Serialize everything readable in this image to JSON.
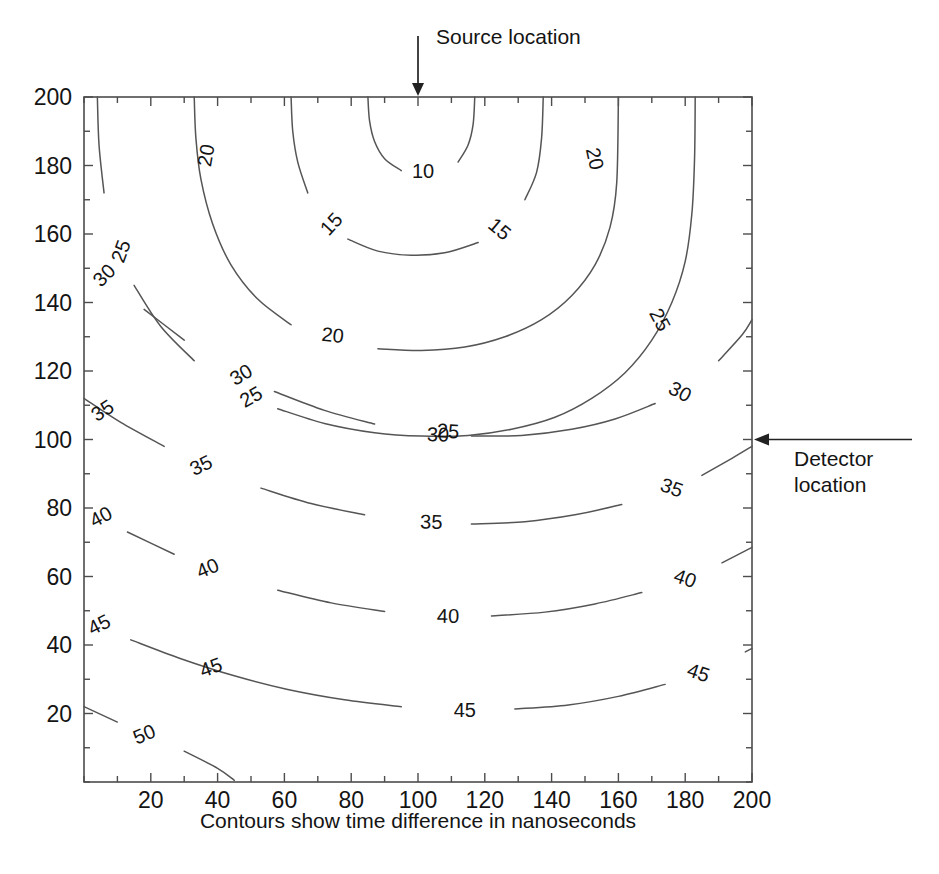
{
  "figure": {
    "kind": "contour-plot",
    "background_color": "#ffffff",
    "line_color": "#555555",
    "axis_color": "#4c4c4c",
    "text_color": "#141414"
  },
  "annotations": [
    {
      "id": "source",
      "label": "Source location",
      "target_x": 100,
      "target_y": 200,
      "direction": "down"
    },
    {
      "id": "detector",
      "label": "Detector\nlocation",
      "label_line1": "Detector",
      "label_line2": "location",
      "target_x": 200,
      "target_y": 100,
      "direction": "left"
    }
  ],
  "chart_data": {
    "type": "line",
    "subtype": "contour",
    "title": "",
    "xlabel": "Contours show time difference in nanoseconds",
    "ylabel": "",
    "xlim": [
      0,
      200
    ],
    "ylim": [
      0,
      200
    ],
    "grid": false,
    "legend": "none",
    "xticks": [
      20,
      40,
      60,
      80,
      100,
      120,
      140,
      160,
      180,
      200
    ],
    "yticks": [
      20,
      40,
      60,
      80,
      100,
      120,
      140,
      160,
      180,
      200
    ],
    "xtick_labels": [
      "20",
      "40",
      "60",
      "80",
      "100",
      "120",
      "140",
      "160",
      "180",
      "200"
    ],
    "ytick_labels": [
      "20",
      "40",
      "60",
      "80",
      "100",
      "120",
      "140",
      "160",
      "180",
      "200"
    ],
    "xtick_minor_step": 10,
    "ytick_minor_step": 10,
    "contour_levels": [
      10,
      15,
      20,
      25,
      30,
      35,
      40,
      45,
      50
    ],
    "contour_unit": "nanoseconds",
    "source_point": [
      100,
      200
    ],
    "detector_point": [
      200,
      100
    ],
    "contours": [
      {
        "level": 10,
        "points": [
          [
            85,
            200
          ],
          [
            85.5,
            193
          ],
          [
            87,
            187
          ],
          [
            90,
            182
          ],
          [
            95,
            178.5
          ],
          [
            101,
            177
          ],
          [
            107,
            178
          ],
          [
            112,
            181
          ],
          [
            115,
            186
          ],
          [
            116.5,
            192
          ],
          [
            117,
            200
          ]
        ],
        "labels": [
          {
            "text": "10",
            "x": 101.5,
            "y": 178.5,
            "rot": 0
          }
        ]
      },
      {
        "level": 15,
        "points": [
          [
            62,
            200
          ],
          [
            62.5,
            190
          ],
          [
            64,
            181
          ],
          [
            67,
            172
          ],
          [
            72,
            164
          ],
          [
            79,
            158.5
          ],
          [
            88,
            155
          ],
          [
            98,
            153.8
          ],
          [
            108,
            154.5
          ],
          [
            118,
            157.5
          ],
          [
            126,
            163
          ],
          [
            132,
            170
          ],
          [
            135.5,
            178
          ],
          [
            137,
            188
          ],
          [
            137.5,
            200
          ]
        ],
        "labels": [
          {
            "text": "15",
            "x": 74,
            "y": 163,
            "rot": -47
          },
          {
            "text": "15",
            "x": 124.5,
            "y": 161.5,
            "rot": 40
          }
        ]
      },
      {
        "level": 20,
        "points": [
          [
            33,
            200
          ],
          [
            33.5,
            188
          ],
          [
            35,
            176
          ],
          [
            38.5,
            163
          ],
          [
            44,
            151
          ],
          [
            52,
            141
          ],
          [
            62,
            133.5
          ],
          [
            74,
            129
          ],
          [
            88,
            126.5
          ],
          [
            101,
            126
          ],
          [
            114,
            127
          ],
          [
            126,
            130
          ],
          [
            137,
            135
          ],
          [
            146,
            142
          ],
          [
            153,
            151
          ],
          [
            157.5,
            162
          ],
          [
            159.5,
            175
          ],
          [
            160,
            200
          ]
        ],
        "labels": [
          {
            "text": "20",
            "x": 36.5,
            "y": 183,
            "rot": -80
          },
          {
            "text": "20",
            "x": 74.5,
            "y": 130.5,
            "rot": 6
          },
          {
            "text": "20",
            "x": 153,
            "y": 182,
            "rot": 78
          }
        ]
      },
      {
        "level": 25,
        "points": [
          [
            4,
            200
          ],
          [
            4.5,
            186
          ],
          [
            6,
            172
          ],
          [
            9.5,
            158
          ],
          [
            15,
            145
          ],
          [
            23,
            133
          ],
          [
            33,
            123
          ],
          [
            45,
            115
          ],
          [
            58,
            109
          ],
          [
            72,
            104.7
          ],
          [
            87,
            102
          ],
          [
            101,
            101
          ],
          [
            115,
            101.2
          ],
          [
            128,
            103
          ],
          [
            141,
            106.5
          ],
          [
            152,
            112
          ],
          [
            162,
            119.5
          ],
          [
            170,
            129
          ],
          [
            176,
            140
          ],
          [
            180,
            152
          ],
          [
            182,
            166
          ],
          [
            182.8,
            182
          ],
          [
            183,
            200
          ]
        ],
        "labels": [
          {
            "text": "25",
            "x": 11,
            "y": 155,
            "rot": -70
          },
          {
            "text": "25",
            "x": 50,
            "y": 112.5,
            "rot": -30
          },
          {
            "text": "25",
            "x": 109,
            "y": 102.5,
            "rot": 3
          },
          {
            "text": "25",
            "x": 172.5,
            "y": 135,
            "rot": 62
          }
        ]
      },
      {
        "level": 30,
        "points": [
          [
            0,
            156
          ],
          [
            8,
            147
          ],
          [
            18,
            138
          ],
          [
            30,
            129
          ],
          [
            43,
            121
          ],
          [
            57,
            114
          ],
          [
            72,
            108.5
          ],
          [
            87,
            104.5
          ],
          [
            101,
            102
          ],
          [
            116,
            101
          ],
          [
            131,
            101.2
          ],
          [
            146,
            103
          ],
          [
            159,
            106
          ],
          [
            171,
            110.5
          ],
          [
            181,
            116
          ],
          [
            190,
            123
          ],
          [
            197,
            130.5
          ],
          [
            200,
            135
          ]
        ],
        "labels": [
          {
            "text": "30",
            "x": 6,
            "y": 148,
            "rot": -45
          },
          {
            "text": "30",
            "x": 47,
            "y": 119,
            "rot": -31
          },
          {
            "text": "30",
            "x": 106,
            "y": 101.5,
            "rot": 2
          },
          {
            "text": "30",
            "x": 178.5,
            "y": 114,
            "rot": 28
          }
        ]
      },
      {
        "level": 35,
        "points": [
          [
            0,
            112
          ],
          [
            11,
            105
          ],
          [
            24,
            98
          ],
          [
            38,
            91.5
          ],
          [
            53,
            85.8
          ],
          [
            68,
            81.3
          ],
          [
            84,
            78
          ],
          [
            100,
            76
          ],
          [
            116,
            75.3
          ],
          [
            132,
            76
          ],
          [
            147,
            78
          ],
          [
            161,
            81
          ],
          [
            174,
            85
          ],
          [
            185,
            89.5
          ],
          [
            194,
            94.5
          ],
          [
            200,
            98
          ]
        ],
        "labels": [
          {
            "text": "35",
            "x": 5.5,
            "y": 108.5,
            "rot": -33
          },
          {
            "text": "35",
            "x": 35,
            "y": 92.5,
            "rot": -26
          },
          {
            "text": "35",
            "x": 104,
            "y": 76,
            "rot": 1
          },
          {
            "text": "35",
            "x": 176,
            "y": 86,
            "rot": 20
          }
        ]
      },
      {
        "level": 40,
        "points": [
          [
            0,
            80
          ],
          [
            13,
            73
          ],
          [
            27,
            66.5
          ],
          [
            42,
            60.8
          ],
          [
            58,
            56
          ],
          [
            74,
            52.3
          ],
          [
            90,
            49.8
          ],
          [
            106,
            48.5
          ],
          [
            122,
            48.5
          ],
          [
            138,
            49.6
          ],
          [
            153,
            52
          ],
          [
            167,
            55.3
          ],
          [
            180,
            59.5
          ],
          [
            191,
            64
          ],
          [
            200,
            68.5
          ]
        ],
        "labels": [
          {
            "text": "40",
            "x": 5,
            "y": 77.5,
            "rot": -28
          },
          {
            "text": "40",
            "x": 37,
            "y": 62.5,
            "rot": -23
          },
          {
            "text": "40",
            "x": 109,
            "y": 48.5,
            "rot": 1
          },
          {
            "text": "40",
            "x": 180,
            "y": 59.5,
            "rot": 19
          }
        ]
      },
      {
        "level": 45,
        "points": [
          [
            0,
            48
          ],
          [
            14,
            41.5
          ],
          [
            29,
            36
          ],
          [
            45,
            31
          ],
          [
            61,
            27
          ],
          [
            78,
            24
          ],
          [
            95,
            22
          ],
          [
            112,
            21
          ],
          [
            129,
            21.3
          ],
          [
            145,
            22.5
          ],
          [
            160,
            25
          ],
          [
            174,
            28.5
          ],
          [
            187,
            33
          ],
          [
            198,
            38
          ],
          [
            200,
            39
          ]
        ],
        "labels": [
          {
            "text": "45",
            "x": 4.5,
            "y": 46,
            "rot": -27
          },
          {
            "text": "45",
            "x": 38,
            "y": 33.5,
            "rot": -20
          },
          {
            "text": "45",
            "x": 114,
            "y": 21,
            "rot": 0
          },
          {
            "text": "45",
            "x": 184,
            "y": 32,
            "rot": 19
          }
        ]
      },
      {
        "level": 50,
        "points": [
          [
            0,
            22
          ],
          [
            10,
            17.5
          ],
          [
            20,
            13.5
          ],
          [
            30,
            9
          ],
          [
            40,
            4
          ],
          [
            45,
            0.5
          ]
        ],
        "labels": [
          {
            "text": "50",
            "x": 18,
            "y": 14,
            "rot": -22
          }
        ]
      }
    ]
  }
}
